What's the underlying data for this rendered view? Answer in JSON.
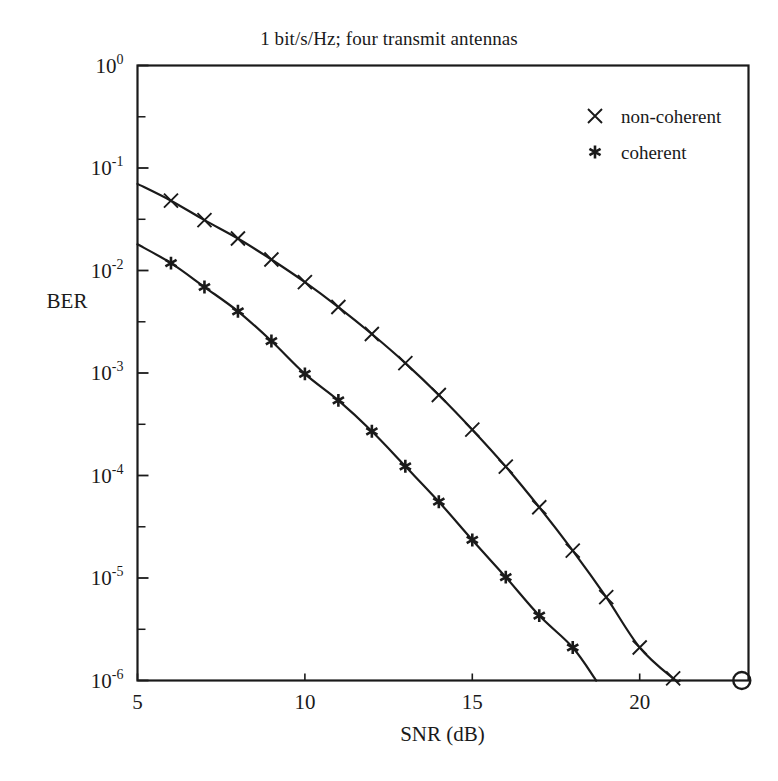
{
  "chart_data": {
    "type": "line",
    "title": "1 bit/s/Hz; four transmit antennas",
    "xlabel": "SNR (dB)",
    "ylabel": "BER",
    "xlim": [
      5,
      23.25
    ],
    "ylim": [
      1e-06,
      1
    ],
    "yscale": "log",
    "xscale": "linear",
    "grid": false,
    "legend_position": "top-right",
    "xticks": [
      5,
      10,
      15,
      20
    ],
    "xtick_labels": [
      "5",
      "10",
      "15",
      "20"
    ],
    "yticks": [
      1,
      0.1,
      0.01,
      0.001,
      0.0001,
      1e-05,
      1e-06
    ],
    "ytick_labels": [
      "10",
      "10",
      "10",
      "10",
      "10",
      "10",
      "10"
    ],
    "ytick_exponents": [
      "0",
      "-1",
      "-2",
      "-3",
      "-4",
      "-5",
      "-6"
    ],
    "y_minor_ticks": [
      0.316,
      0.0316,
      0.00316,
      0.000316,
      3.16e-05,
      3.16e-06
    ],
    "series": [
      {
        "name": "non-coherent",
        "marker": "x",
        "color": "#1a1a1a",
        "x": [
          5,
          6,
          7,
          8,
          9,
          10,
          11,
          12,
          13,
          14,
          15,
          16,
          17,
          18,
          19,
          20,
          21,
          21.2
        ],
        "values": [
          0.07,
          0.048,
          0.031,
          0.0205,
          0.0128,
          0.0077,
          0.0044,
          0.0024,
          0.00125,
          0.00061,
          0.00028,
          0.000122,
          4.9e-05,
          1.85e-05,
          6.5e-06,
          2.1e-06,
          1.05e-06,
          1e-06
        ]
      },
      {
        "name": "coherent",
        "marker": "*",
        "color": "#1a1a1a",
        "x": [
          5,
          6,
          7,
          8,
          9,
          10,
          11,
          12,
          13,
          14,
          15,
          16,
          17,
          18,
          18.7
        ],
        "values": [
          0.018,
          0.0118,
          0.0069,
          0.004,
          0.00205,
          0.00098,
          0.00054,
          0.00027,
          0.000123,
          5.55e-05,
          2.35e-05,
          1.02e-05,
          4.3e-06,
          2.1e-06,
          1e-06
        ]
      }
    ],
    "annotations": [
      {
        "name": "corner-circle-marker",
        "marker": "o",
        "x": 23.05,
        "y": 1e-06
      }
    ]
  },
  "legend": {
    "entries": [
      {
        "marker": "x",
        "label": "non-coherent"
      },
      {
        "marker": "*",
        "label": "coherent"
      }
    ]
  },
  "axes": {
    "title": "1 bit/s/Hz; four transmit antennas",
    "x_label": "SNR (dB)",
    "y_label": "BER"
  }
}
